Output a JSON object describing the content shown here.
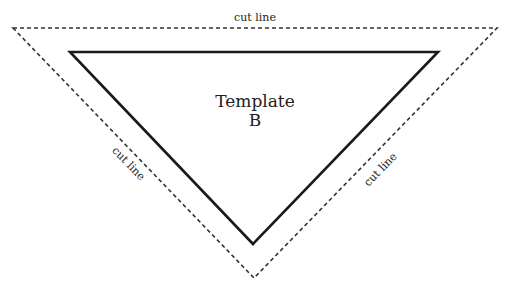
{
  "diagram": {
    "title_line1": "Template",
    "title_line2": "B",
    "labels": {
      "top": "cut line",
      "left": "cut line",
      "right": "cut line"
    },
    "colors": {
      "stroke": "#1a1a1a",
      "dashed": "#333333",
      "background": "#ffffff"
    },
    "outer_triangle": {
      "style": "dashed",
      "points": [
        [
          13,
          28
        ],
        [
          497,
          28
        ],
        [
          254,
          278
        ]
      ]
    },
    "inner_triangle": {
      "style": "solid",
      "points": [
        [
          70,
          52
        ],
        [
          438,
          52
        ],
        [
          253,
          244
        ]
      ]
    }
  }
}
